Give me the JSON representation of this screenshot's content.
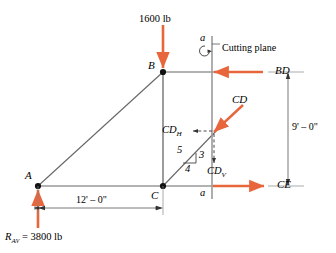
{
  "figure": {
    "type": "truss-section-free-body-diagram",
    "colors": {
      "force_arrow": "#E8663C",
      "member_line": "#555555",
      "dimension_line": "#666666",
      "cutting_plane": "#999999",
      "text": "#000000"
    }
  },
  "nodes": [
    {
      "id": "A",
      "label": "A",
      "x": 38,
      "y": 186
    },
    {
      "id": "B",
      "label": "B",
      "x": 163,
      "y": 72
    },
    {
      "id": "C",
      "label": "C",
      "x": 163,
      "y": 186
    }
  ],
  "applied_loads": [
    {
      "name": "top-load",
      "label": "1600 lb",
      "direction": "down",
      "at_node": "B"
    },
    {
      "name": "support-reaction",
      "label_main": "R",
      "label_sub": "A",
      "label_sub2": "V",
      "label_value": "= 3800 lb",
      "label_full": "R_AV = 3800 lb",
      "direction": "up",
      "at_node": "A"
    }
  ],
  "member_forces": [
    {
      "name": "BD",
      "label": "BD",
      "direction": "left",
      "description": "top chord force at cut"
    },
    {
      "name": "CD",
      "label": "CD",
      "direction": "up-right",
      "description": "diagonal web force at cut"
    },
    {
      "name": "CD_H",
      "label_main": "CD",
      "label_sub": "H",
      "label_full": "CDH",
      "direction": "left",
      "style": "dashed",
      "description": "horizontal component of CD"
    },
    {
      "name": "CD_V",
      "label_main": "CD",
      "label_sub": "V",
      "label_full": "CDV",
      "direction": "down",
      "style": "dashed",
      "description": "vertical component of CD"
    },
    {
      "name": "CE",
      "label": "CE",
      "direction": "right",
      "description": "bottom chord force at cut"
    }
  ],
  "cutting_plane": {
    "label": "Cutting plane",
    "section_mark_top": "a",
    "section_mark_bottom": "a"
  },
  "slope_triangle": {
    "hypotenuse": "5",
    "vertical": "3",
    "horizontal": "4"
  },
  "dimensions": [
    {
      "name": "span-AC",
      "label": "12' – 0\"",
      "orientation": "horizontal"
    },
    {
      "name": "height-BC",
      "label": "9' – 0\"",
      "orientation": "vertical"
    }
  ]
}
